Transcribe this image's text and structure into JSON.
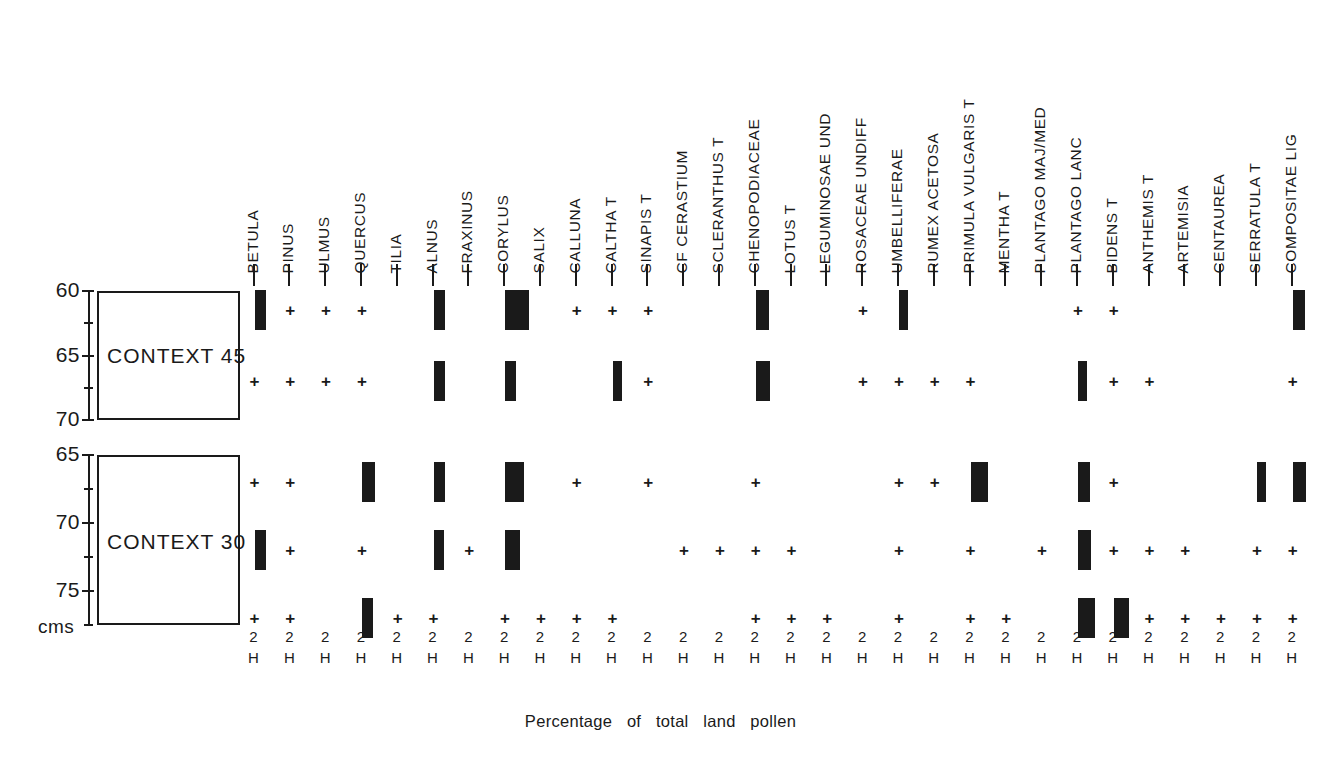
{
  "figure": {
    "caption": "Percentage   of   total   land   pollen",
    "depth_unit_label": "cms",
    "scale_numerator": "2",
    "scale_denominator": "H",
    "mark_plus": "+"
  },
  "taxa": [
    "BETULA",
    "PINUS",
    "ULMUS",
    "QUERCUS",
    "TILIA",
    "ALNUS",
    "FRAXINUS",
    "CORYLUS",
    "SALIX",
    "CALLUNA",
    "CALTHA T",
    "SINAPIS T",
    "CF CERASTIUM",
    "SCLERANTHUS  T",
    "CHENOPODIACEAE",
    "LOTUS T",
    "LEGUMINOSAE  UND",
    "ROSACEAE  UNDIFF",
    "UMBELLIFERAE",
    "RUMEX ACETOSA",
    "PRIMULA VULGARIS T",
    "MENTHA T",
    "PLANTAGO  MAJ/MED",
    "PLANTAGO  LANC",
    "BIDENS T",
    "ANTHEMIS T",
    "ARTEMISIA",
    "CENTAUREA",
    "SERRATULA T",
    "COMPOSITAE LIG"
  ],
  "contexts": [
    {
      "name": "CONTEXT 45",
      "depth_labels": [
        "60",
        "65",
        "70"
      ],
      "samples": [
        {
          "depth": 61.5,
          "marks": [
            {
              "taxon": "BETULA",
              "type": "bar",
              "width": 2.0
            },
            {
              "taxon": "PINUS",
              "type": "plus"
            },
            {
              "taxon": "ULMUS",
              "type": "plus"
            },
            {
              "taxon": "QUERCUS",
              "type": "plus"
            },
            {
              "taxon": "ALNUS",
              "type": "bar",
              "width": 2.0
            },
            {
              "taxon": "CORYLUS",
              "type": "bar",
              "width": 4.2
            },
            {
              "taxon": "CALLUNA",
              "type": "plus"
            },
            {
              "taxon": "CALTHA T",
              "type": "plus"
            },
            {
              "taxon": "SINAPIS T",
              "type": "plus"
            },
            {
              "taxon": "CHENOPODIACEAE",
              "type": "bar",
              "width": 2.4
            },
            {
              "taxon": "ROSACEAE  UNDIFF",
              "type": "plus"
            },
            {
              "taxon": "UMBELLIFERAE",
              "type": "bar",
              "width": 1.7
            },
            {
              "taxon": "PLANTAGO  LANC",
              "type": "plus"
            },
            {
              "taxon": "BIDENS T",
              "type": "plus"
            },
            {
              "taxon": "COMPOSITAE LIG",
              "type": "bar",
              "width": 2.2
            }
          ]
        },
        {
          "depth": 67.0,
          "marks": [
            {
              "taxon": "BETULA",
              "type": "plus"
            },
            {
              "taxon": "PINUS",
              "type": "plus"
            },
            {
              "taxon": "ULMUS",
              "type": "plus"
            },
            {
              "taxon": "QUERCUS",
              "type": "plus"
            },
            {
              "taxon": "ALNUS",
              "type": "bar",
              "width": 2.0
            },
            {
              "taxon": "CORYLUS",
              "type": "bar",
              "width": 1.9
            },
            {
              "taxon": "CALTHA T",
              "type": "bar",
              "width": 1.7
            },
            {
              "taxon": "SINAPIS T",
              "type": "plus"
            },
            {
              "taxon": "CHENOPODIACEAE",
              "type": "bar",
              "width": 2.6
            },
            {
              "taxon": "ROSACEAE  UNDIFF",
              "type": "plus"
            },
            {
              "taxon": "UMBELLIFERAE",
              "type": "plus"
            },
            {
              "taxon": "RUMEX ACETOSA",
              "type": "plus"
            },
            {
              "taxon": "PRIMULA VULGARIS T",
              "type": "plus"
            },
            {
              "taxon": "PLANTAGO  LANC",
              "type": "bar",
              "width": 1.7
            },
            {
              "taxon": "BIDENS T",
              "type": "plus"
            },
            {
              "taxon": "ANTHEMIS T",
              "type": "plus"
            },
            {
              "taxon": "COMPOSITAE LIG",
              "type": "plus"
            }
          ]
        }
      ]
    },
    {
      "name": "CONTEXT 30",
      "depth_labels": [
        "65",
        "70",
        "75"
      ],
      "samples": [
        {
          "depth": 67.0,
          "marks": [
            {
              "taxon": "BETULA",
              "type": "plus"
            },
            {
              "taxon": "PINUS",
              "type": "plus"
            },
            {
              "taxon": "QUERCUS",
              "type": "bar",
              "width": 2.3
            },
            {
              "taxon": "ALNUS",
              "type": "bar",
              "width": 2.1
            },
            {
              "taxon": "CORYLUS",
              "type": "bar",
              "width": 3.3
            },
            {
              "taxon": "CALLUNA",
              "type": "plus"
            },
            {
              "taxon": "SINAPIS T",
              "type": "plus"
            },
            {
              "taxon": "CHENOPODIACEAE",
              "type": "plus"
            },
            {
              "taxon": "UMBELLIFERAE",
              "type": "plus"
            },
            {
              "taxon": "RUMEX ACETOSA",
              "type": "plus"
            },
            {
              "taxon": "PRIMULA VULGARIS T",
              "type": "bar",
              "width": 3.1
            },
            {
              "taxon": "PLANTAGO  LANC",
              "type": "bar",
              "width": 2.2
            },
            {
              "taxon": "BIDENS T",
              "type": "plus"
            },
            {
              "taxon": "SERRATULA T",
              "type": "bar",
              "width": 1.7
            },
            {
              "taxon": "COMPOSITAE LIG",
              "type": "bar",
              "width": 2.3
            }
          ]
        },
        {
          "depth": 72.0,
          "marks": [
            {
              "taxon": "BETULA",
              "type": "bar",
              "width": 2.0
            },
            {
              "taxon": "PINUS",
              "type": "plus"
            },
            {
              "taxon": "QUERCUS",
              "type": "plus"
            },
            {
              "taxon": "ALNUS",
              "type": "bar",
              "width": 1.9
            },
            {
              "taxon": "FRAXINUS",
              "type": "plus"
            },
            {
              "taxon": "CORYLUS",
              "type": "bar",
              "width": 2.6
            },
            {
              "taxon": "CF CERASTIUM",
              "type": "plus"
            },
            {
              "taxon": "SCLERANTHUS  T",
              "type": "plus"
            },
            {
              "taxon": "CHENOPODIACEAE",
              "type": "plus"
            },
            {
              "taxon": "LOTUS T",
              "type": "plus"
            },
            {
              "taxon": "UMBELLIFERAE",
              "type": "plus"
            },
            {
              "taxon": "PRIMULA VULGARIS T",
              "type": "plus"
            },
            {
              "taxon": "PLANTAGO  MAJ/MED",
              "type": "plus"
            },
            {
              "taxon": "PLANTAGO  LANC",
              "type": "bar",
              "width": 2.4
            },
            {
              "taxon": "BIDENS T",
              "type": "plus"
            },
            {
              "taxon": "ANTHEMIS T",
              "type": "plus"
            },
            {
              "taxon": "ARTEMISIA",
              "type": "plus"
            },
            {
              "taxon": "SERRATULA T",
              "type": "plus"
            },
            {
              "taxon": "COMPOSITAE LIG",
              "type": "plus"
            }
          ]
        },
        {
          "depth": 77.0,
          "marks": [
            {
              "taxon": "BETULA",
              "type": "plus"
            },
            {
              "taxon": "PINUS",
              "type": "plus"
            },
            {
              "taxon": "QUERCUS",
              "type": "bar",
              "width": 2.0
            },
            {
              "taxon": "TILIA",
              "type": "plus"
            },
            {
              "taxon": "ALNUS",
              "type": "plus"
            },
            {
              "taxon": "CORYLUS",
              "type": "plus"
            },
            {
              "taxon": "SALIX",
              "type": "plus"
            },
            {
              "taxon": "CALLUNA",
              "type": "plus"
            },
            {
              "taxon": "CALTHA T",
              "type": "plus"
            },
            {
              "taxon": "CHENOPODIACEAE",
              "type": "plus"
            },
            {
              "taxon": "LOTUS T",
              "type": "plus"
            },
            {
              "taxon": "LEGUMINOSAE  UND",
              "type": "plus"
            },
            {
              "taxon": "UMBELLIFERAE",
              "type": "plus"
            },
            {
              "taxon": "PRIMULA VULGARIS T",
              "type": "plus"
            },
            {
              "taxon": "MENTHA T",
              "type": "plus"
            },
            {
              "taxon": "PLANTAGO  LANC",
              "type": "bar",
              "width": 3.0
            },
            {
              "taxon": "BIDENS T",
              "type": "bar",
              "width": 2.7
            },
            {
              "taxon": "ANTHEMIS T",
              "type": "plus"
            },
            {
              "taxon": "ARTEMISIA",
              "type": "plus"
            },
            {
              "taxon": "CENTAUREA",
              "type": "plus"
            },
            {
              "taxon": "SERRATULA T",
              "type": "plus"
            },
            {
              "taxon": "COMPOSITAE LIG",
              "type": "plus"
            }
          ]
        }
      ]
    }
  ],
  "chart_data": {
    "type": "bar",
    "title": "",
    "xlabel": "Percentage   of   total   land   pollen",
    "ylabel": "cms",
    "grid": false,
    "legend": "none",
    "orientation": "horizontal-columns-per-taxon",
    "scale_bar": "2 %  (H)",
    "categories": [
      "BETULA",
      "PINUS",
      "ULMUS",
      "QUERCUS",
      "TILIA",
      "ALNUS",
      "FRAXINUS",
      "CORYLUS",
      "SALIX",
      "CALLUNA",
      "CALTHA T",
      "SINAPIS T",
      "CF CERASTIUM",
      "SCLERANTHUS  T",
      "CHENOPODIACEAE",
      "LOTUS T",
      "LEGUMINOSAE  UND",
      "ROSACEAE  UNDIFF",
      "UMBELLIFERAE",
      "RUMEX ACETOSA",
      "PRIMULA VULGARIS T",
      "MENTHA T",
      "PLANTAGO  MAJ/MED",
      "PLANTAGO  LANC",
      "BIDENS T",
      "ANTHEMIS T",
      "ARTEMISIA",
      "CENTAUREA",
      "SERRATULA T",
      "COMPOSITAE LIG"
    ],
    "series": [
      {
        "name": "CONTEXT 45 @ 61.5 cms",
        "values": [
          2.0,
          0.2,
          0.2,
          0.2,
          0,
          2.0,
          0,
          4.2,
          0,
          0.2,
          0.2,
          0.2,
          0,
          0,
          2.4,
          0,
          0,
          0.2,
          1.7,
          0,
          0,
          0,
          0,
          0.2,
          0.2,
          0,
          0,
          0,
          0,
          2.2
        ]
      },
      {
        "name": "CONTEXT 45 @ 67 cms",
        "values": [
          0.2,
          0.2,
          0.2,
          0.2,
          0,
          2.0,
          0,
          1.9,
          0,
          0,
          1.7,
          0.2,
          0,
          0,
          2.6,
          0,
          0,
          0.2,
          0.2,
          0.2,
          0.2,
          0,
          0,
          1.7,
          0.2,
          0.2,
          0,
          0,
          0,
          0.2
        ]
      },
      {
        "name": "CONTEXT 30 @ 67 cms",
        "values": [
          0.2,
          0.2,
          0,
          2.3,
          0,
          2.1,
          0,
          3.3,
          0,
          0.2,
          0,
          0.2,
          0,
          0,
          0.2,
          0,
          0,
          0,
          0.2,
          0.2,
          3.1,
          0,
          0,
          2.2,
          0.2,
          0,
          0,
          0,
          1.7,
          2.3
        ]
      },
      {
        "name": "CONTEXT 30 @ 72 cms",
        "values": [
          2.0,
          0.2,
          0,
          0.2,
          0,
          1.9,
          0.2,
          2.6,
          0,
          0,
          0,
          0,
          0.2,
          0.2,
          0.2,
          0.2,
          0,
          0,
          0.2,
          0,
          0.2,
          0,
          0.2,
          2.4,
          0.2,
          0.2,
          0.2,
          0,
          0.2,
          0.2
        ]
      },
      {
        "name": "CONTEXT 30 @ 77 cms",
        "values": [
          0.2,
          0.2,
          0,
          2.0,
          0.2,
          0.2,
          0,
          0.2,
          0.2,
          0.2,
          0.2,
          0,
          0,
          0,
          0.2,
          0.2,
          0.2,
          0,
          0.2,
          0,
          0.2,
          0.2,
          0,
          3.0,
          2.7,
          0.2,
          0.2,
          0.2,
          0.2,
          0.2
        ]
      }
    ],
    "note": "Values of 0.2 denote '+' (present, below the plotted percentage threshold); 0 denotes absent."
  }
}
